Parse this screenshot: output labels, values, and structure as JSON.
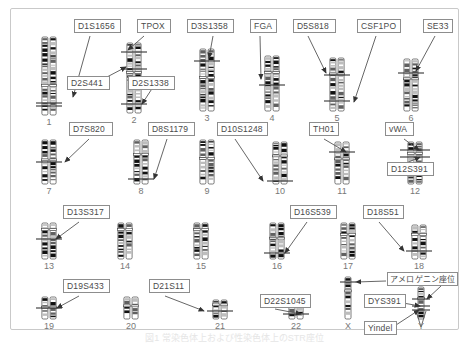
{
  "figure": {
    "caption": "図1  常染色体上および性染色体上のSTR座位",
    "frame_color": "#c9c9c9"
  },
  "chart_data": {
    "type": "diagram",
    "xlabel": "",
    "ylabel": "",
    "rows": 4,
    "chromosomes": [
      {
        "id": "1",
        "number": "1",
        "row": 1,
        "cx": 38,
        "top": 28,
        "height": 78,
        "pair": true,
        "cen": 0.62,
        "loci": [
          "D1S1656"
        ]
      },
      {
        "id": "2",
        "number": "2",
        "row": 1,
        "cx": 123,
        "top": 34,
        "height": 70,
        "pair": true,
        "cen": 0.42,
        "loci": [
          "TPOX",
          "D2S441",
          "D2S1338"
        ]
      },
      {
        "id": "3",
        "number": "3",
        "row": 1,
        "cx": 196,
        "top": 40,
        "height": 62,
        "pair": true,
        "cen": 0.46,
        "loci": [
          "D3S1358"
        ]
      },
      {
        "id": "4",
        "number": "4",
        "row": 1,
        "cx": 261,
        "top": 47,
        "height": 55,
        "pair": true,
        "cen": 0.3,
        "loci": [
          "FGA"
        ]
      },
      {
        "id": "5",
        "number": "5",
        "row": 1,
        "cx": 326,
        "top": 49,
        "height": 53,
        "pair": true,
        "cen": 0.3,
        "loci": [
          "D5S818",
          "CSF1PO"
        ]
      },
      {
        "id": "6",
        "number": "6",
        "row": 1,
        "cx": 400,
        "top": 50,
        "height": 52,
        "pair": true,
        "cen": 0.38,
        "loci": [
          "SE33"
        ]
      },
      {
        "id": "7",
        "number": "7",
        "row": 2,
        "cx": 38,
        "top": 131,
        "height": 44,
        "pair": true,
        "cen": 0.45,
        "loci": [
          "D7S820"
        ]
      },
      {
        "id": "8",
        "number": "8",
        "row": 2,
        "cx": 130,
        "top": 131,
        "height": 44,
        "pair": true,
        "cen": 0.33,
        "loci": [
          "D8S1179"
        ]
      },
      {
        "id": "9",
        "number": "9",
        "row": 2,
        "cx": 196,
        "top": 131,
        "height": 44,
        "pair": true,
        "cen": 0.42,
        "loci": []
      },
      {
        "id": "10",
        "number": "10",
        "row": 2,
        "cx": 269,
        "top": 133,
        "height": 42,
        "pair": true,
        "cen": 0.33,
        "loci": [
          "D10S1248"
        ]
      },
      {
        "id": "11",
        "number": "11",
        "row": 2,
        "cx": 331,
        "top": 133,
        "height": 42,
        "pair": true,
        "cen": 0.4,
        "loci": [
          "TH01"
        ]
      },
      {
        "id": "12",
        "number": "12",
        "row": 2,
        "cx": 404,
        "top": 133,
        "height": 42,
        "pair": true,
        "cen": 0.27,
        "loci": [
          "vWA",
          "D12S391"
        ]
      },
      {
        "id": "13",
        "number": "13",
        "row": 3,
        "cx": 38,
        "top": 214,
        "height": 36,
        "pair": true,
        "cen": 0.18,
        "loci": [
          "D13S317"
        ]
      },
      {
        "id": "14",
        "number": "14",
        "row": 3,
        "cx": 114,
        "top": 214,
        "height": 36,
        "pair": true,
        "cen": 0.18,
        "loci": []
      },
      {
        "id": "15",
        "number": "15",
        "row": 3,
        "cx": 190,
        "top": 214,
        "height": 36,
        "pair": true,
        "cen": 0.18,
        "loci": []
      },
      {
        "id": "16",
        "number": "16",
        "row": 3,
        "cx": 266,
        "top": 214,
        "height": 36,
        "pair": true,
        "cen": 0.42,
        "loci": [
          "D16S539"
        ]
      },
      {
        "id": "17",
        "number": "17",
        "row": 3,
        "cx": 337,
        "top": 214,
        "height": 36,
        "pair": true,
        "cen": 0.32,
        "loci": []
      },
      {
        "id": "18",
        "number": "18",
        "row": 3,
        "cx": 408,
        "top": 216,
        "height": 34,
        "pair": true,
        "cen": 0.28,
        "loci": [
          "D18S51"
        ]
      },
      {
        "id": "19",
        "number": "19",
        "row": 4,
        "cx": 38,
        "top": 288,
        "height": 22,
        "pair": true,
        "cen": 0.46,
        "loci": [
          "D19S433"
        ]
      },
      {
        "id": "20",
        "number": "20",
        "row": 4,
        "cx": 120,
        "top": 288,
        "height": 22,
        "pair": true,
        "cen": 0.4,
        "loci": []
      },
      {
        "id": "21",
        "number": "21",
        "row": 4,
        "cx": 209,
        "top": 291,
        "height": 19,
        "pair": true,
        "cen": 0.25,
        "loci": [
          "D21S11"
        ]
      },
      {
        "id": "22",
        "number": "22",
        "row": 4,
        "cx": 285,
        "top": 291,
        "height": 19,
        "pair": true,
        "cen": 0.25,
        "loci": [
          "D22S1045"
        ]
      },
      {
        "id": "X",
        "number": "X",
        "row": 4,
        "cx": 337,
        "top": 268,
        "height": 42,
        "pair": false,
        "cen": 0.33,
        "loci": [
          "アメロゲニン座位"
        ]
      },
      {
        "id": "Y",
        "number": "Y",
        "row": 4,
        "cx": 410,
        "top": 278,
        "height": 32,
        "pair": false,
        "cen": 0.35,
        "loci": [
          "アメロゲニン座位",
          "DYS391",
          "Yindel"
        ]
      }
    ],
    "labels": [
      {
        "id": "D1S1656",
        "text": "D1S1656",
        "x": 63,
        "y": 10,
        "w": 47,
        "h": 14
      },
      {
        "id": "TPOX",
        "text": "TPOX",
        "x": 126,
        "y": 10,
        "w": 34,
        "h": 14
      },
      {
        "id": "D3S1358",
        "text": "D3S1358",
        "x": 176,
        "y": 10,
        "w": 47,
        "h": 14
      },
      {
        "id": "FGA",
        "text": "FGA",
        "x": 239,
        "y": 10,
        "w": 27,
        "h": 14
      },
      {
        "id": "D5S818",
        "text": "D5S818",
        "x": 282,
        "y": 10,
        "w": 43,
        "h": 14
      },
      {
        "id": "CSF1PO",
        "text": "CSF1PO",
        "x": 346,
        "y": 10,
        "w": 44,
        "h": 14
      },
      {
        "id": "SE33",
        "text": "SE33",
        "x": 412,
        "y": 10,
        "w": 30,
        "h": 14
      },
      {
        "id": "D2S441",
        "text": "D2S441",
        "x": 56,
        "y": 67,
        "w": 43,
        "h": 14
      },
      {
        "id": "D2S1338",
        "text": "D2S1338",
        "x": 117,
        "y": 67,
        "w": 47,
        "h": 14
      },
      {
        "id": "D7S820",
        "text": "D7S820",
        "x": 58,
        "y": 113,
        "w": 44,
        "h": 14
      },
      {
        "id": "D8S1179",
        "text": "D8S1179",
        "x": 137,
        "y": 113,
        "w": 47,
        "h": 14
      },
      {
        "id": "D10S1248",
        "text": "D10S1248",
        "x": 206,
        "y": 113,
        "w": 51,
        "h": 14
      },
      {
        "id": "TH01",
        "text": "TH01",
        "x": 298,
        "y": 113,
        "w": 30,
        "h": 14
      },
      {
        "id": "vWA",
        "text": "vWA",
        "x": 374,
        "y": 113,
        "w": 29,
        "h": 14
      },
      {
        "id": "D12S391",
        "text": "D12S391",
        "x": 376,
        "y": 153,
        "w": 47,
        "h": 14
      },
      {
        "id": "D13S317",
        "text": "D13S317",
        "x": 52,
        "y": 196,
        "w": 47,
        "h": 14
      },
      {
        "id": "D16S539",
        "text": "D16S539",
        "x": 279,
        "y": 196,
        "w": 47,
        "h": 14
      },
      {
        "id": "D18S51",
        "text": "D18S51",
        "x": 352,
        "y": 196,
        "w": 41,
        "h": 14
      },
      {
        "id": "D19S433",
        "text": "D19S433",
        "x": 52,
        "y": 270,
        "w": 47,
        "h": 14
      },
      {
        "id": "D21S11",
        "text": "D21S11",
        "x": 138,
        "y": 270,
        "w": 41,
        "h": 14
      },
      {
        "id": "D22S1045",
        "text": "D22S1045",
        "x": 249,
        "y": 285,
        "w": 51,
        "h": 14
      },
      {
        "id": "DYS391",
        "text": "DYS391",
        "x": 353,
        "y": 285,
        "w": 42,
        "h": 14
      },
      {
        "id": "Yindel",
        "text": "Yindel",
        "x": 353,
        "y": 312,
        "w": 33,
        "h": 14
      },
      {
        "id": "AMEL",
        "text": "アメロゲニン座位",
        "x": 376,
        "y": 263,
        "w": 71,
        "h": 14
      }
    ]
  }
}
